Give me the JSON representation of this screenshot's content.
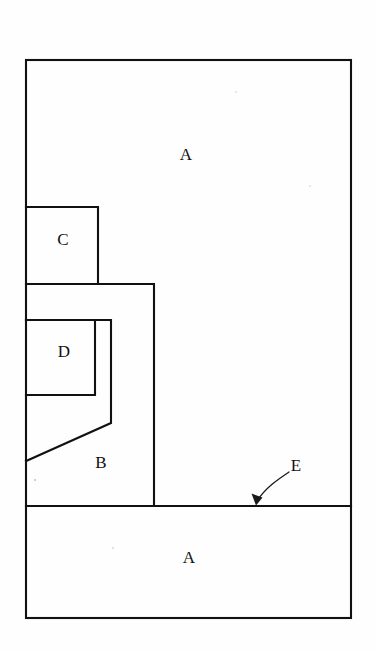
{
  "figure": {
    "background_color": "#fefefe",
    "line_color": "#111111",
    "canvas": {
      "width": 375,
      "height": 653
    },
    "labels": [
      {
        "id": "label-a-upper",
        "text": "A",
        "x": 186,
        "y": 156
      },
      {
        "id": "label-c",
        "text": "C",
        "x": 63,
        "y": 241
      },
      {
        "id": "label-d",
        "text": "D",
        "x": 64,
        "y": 353
      },
      {
        "id": "label-b",
        "text": "B",
        "x": 101,
        "y": 464
      },
      {
        "id": "label-a-lower",
        "text": "A",
        "x": 189,
        "y": 559
      },
      {
        "id": "label-e",
        "text": "E",
        "x": 296,
        "y": 467
      }
    ],
    "regions": {
      "outer_boundary": {
        "name": "A",
        "left": 26,
        "top": 60,
        "right": 351,
        "bottom": 618
      },
      "box_c": {
        "name": "C",
        "left": 26,
        "top": 207,
        "right": 98,
        "bottom": 284
      },
      "box_d": {
        "name": "D",
        "left": 26,
        "top": 320,
        "right": 95,
        "bottom": 395
      },
      "region_b": {
        "name": "B",
        "left": 26,
        "top": 284,
        "right": 154,
        "bottom": 506
      },
      "inner_channel": {
        "name": "B inner notch with chamfer",
        "vertical_x": 111,
        "vertical_top": 320,
        "vertical_bottom": 423,
        "chamfer_end_x": 26,
        "chamfer_end_y": 461
      },
      "interface_line": {
        "name": "E",
        "y": 506,
        "x_start": 26,
        "x_end": 351
      }
    },
    "annotation_e": {
      "label": "E",
      "leader_start_x": 289,
      "leader_start_y": 472,
      "leader_end_x": 256,
      "leader_end_y": 503,
      "points_to": "interface line between upper A/B block and lower A block"
    },
    "specks": [
      {
        "x": 35,
        "y": 480
      },
      {
        "x": 113,
        "y": 548
      },
      {
        "x": 236,
        "y": 92
      },
      {
        "x": 310,
        "y": 186
      }
    ]
  }
}
